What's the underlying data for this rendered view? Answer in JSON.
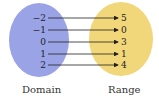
{
  "diagram": {
    "domain_label": "Domain",
    "range_label": "Range",
    "domain": [
      "−2",
      "−1",
      "0",
      "1",
      "2"
    ],
    "range": [
      "5",
      "0",
      "3",
      "1",
      "4"
    ],
    "mappings": [
      [
        "−2",
        "5"
      ],
      [
        "−1",
        "0"
      ],
      [
        "0",
        "3"
      ],
      [
        "1",
        "1"
      ],
      [
        "2",
        "4"
      ]
    ],
    "colors": {
      "domain": "#9aa3e6",
      "range": "#f2d77a"
    }
  }
}
